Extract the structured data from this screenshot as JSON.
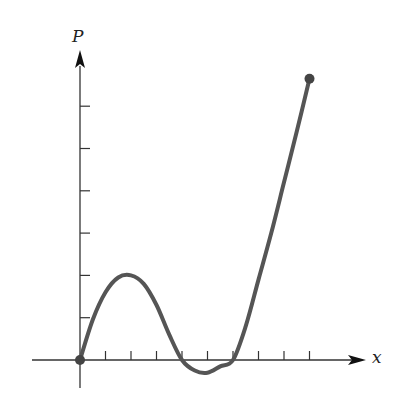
{
  "chart_data": {
    "type": "line",
    "title": "",
    "xlabel": "x",
    "ylabel": "P",
    "x_ticks": [
      1,
      2,
      3,
      4,
      5,
      6,
      7,
      8,
      9
    ],
    "y_ticks": [
      1,
      2,
      3,
      4,
      5,
      6
    ],
    "xlim": [
      0,
      10.5
    ],
    "ylim": [
      -0.3,
      6.9
    ],
    "grid": false,
    "tick_labels_shown": false,
    "series": [
      {
        "name": "P(x)",
        "color": "#555555",
        "x": [
          0,
          0.5,
          1,
          1.5,
          2,
          2.5,
          3,
          3.5,
          4,
          4.5,
          5,
          5.5,
          6,
          6.5,
          7,
          7.5,
          8,
          8.5,
          9
        ],
        "y": [
          0,
          0.95,
          1.6,
          1.95,
          2.0,
          1.8,
          1.3,
          0.6,
          0.0,
          -0.25,
          -0.3,
          -0.15,
          0.0,
          0.8,
          1.9,
          3.0,
          4.2,
          5.4,
          6.65
        ]
      }
    ],
    "endpoints": [
      {
        "x": 0,
        "y": 0,
        "marker": "filled-circle"
      },
      {
        "x": 9,
        "y": 6.65,
        "marker": "filled-circle"
      }
    ]
  },
  "labels": {
    "y_axis": "P",
    "x_axis": "x"
  }
}
